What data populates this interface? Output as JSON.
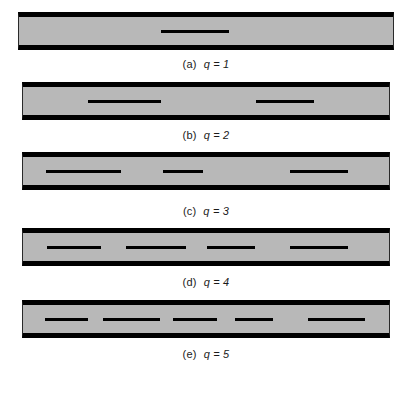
{
  "figure": {
    "background_color": "#ffffff",
    "bar_fill_color": "#b8b8b8",
    "bar_edge_color": "#000000",
    "crack_color": "#000000",
    "panel_count": 5
  },
  "panels": [
    {
      "id": "a",
      "caption_label": "(a)",
      "caption_expr": "q = 1",
      "variable": "q",
      "value": 1,
      "crack_count": 1,
      "bar": {
        "x": 18,
        "y": 12,
        "width": 376,
        "height": 38
      },
      "cracks": [
        {
          "x": 161,
          "y": 30,
          "width": 68
        }
      ]
    },
    {
      "id": "b",
      "caption_label": "(b)",
      "caption_expr": "q = 2",
      "variable": "q",
      "value": 2,
      "crack_count": 2,
      "bar": {
        "x": 22,
        "y": 82,
        "width": 368,
        "height": 38
      },
      "cracks": [
        {
          "x": 88,
          "y": 100,
          "width": 73
        },
        {
          "x": 256,
          "y": 100,
          "width": 58
        }
      ]
    },
    {
      "id": "c",
      "caption_label": "(c)",
      "caption_expr": "q = 3",
      "variable": "q",
      "value": 3,
      "crack_count": 3,
      "bar": {
        "x": 22,
        "y": 152,
        "width": 368,
        "height": 38
      },
      "cracks": [
        {
          "x": 46,
          "y": 170,
          "width": 75
        },
        {
          "x": 163,
          "y": 170,
          "width": 40
        },
        {
          "x": 290,
          "y": 170,
          "width": 58
        }
      ]
    },
    {
      "id": "d",
      "caption_label": "(d)",
      "caption_expr": "q = 4",
      "variable": "q",
      "value": 4,
      "crack_count": 4,
      "bar": {
        "x": 22,
        "y": 228,
        "width": 368,
        "height": 38
      },
      "cracks": [
        {
          "x": 47,
          "y": 246,
          "width": 54
        },
        {
          "x": 126,
          "y": 246,
          "width": 60
        },
        {
          "x": 207,
          "y": 246,
          "width": 48
        },
        {
          "x": 290,
          "y": 246,
          "width": 58
        }
      ]
    },
    {
      "id": "e",
      "caption_label": "(e)",
      "caption_expr": "q = 5",
      "variable": "q",
      "value": 5,
      "crack_count": 5,
      "bar": {
        "x": 22,
        "y": 300,
        "width": 368,
        "height": 38
      },
      "cracks": [
        {
          "x": 45,
          "y": 318,
          "width": 43
        },
        {
          "x": 103,
          "y": 318,
          "width": 57
        },
        {
          "x": 173,
          "y": 318,
          "width": 44
        },
        {
          "x": 235,
          "y": 318,
          "width": 38
        },
        {
          "x": 308,
          "y": 318,
          "width": 57
        }
      ]
    }
  ],
  "captions": [
    {
      "y": 58,
      "label": "(a)",
      "expr": "q = 1"
    },
    {
      "y": 129,
      "label": "(b)",
      "expr": "q = 2"
    },
    {
      "y": 205,
      "label": "(c)",
      "expr": "q = 3"
    },
    {
      "y": 276,
      "label": "(d)",
      "expr": "q = 4"
    },
    {
      "y": 348,
      "label": "(e)",
      "expr": "q = 5"
    }
  ]
}
